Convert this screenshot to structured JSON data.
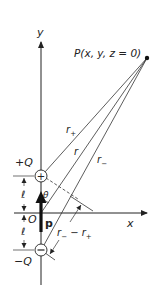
{
  "figure": {
    "type": "electric-dipole-geometry",
    "axes": {
      "x_label": "x",
      "y_label": "y",
      "origin_label": "O"
    },
    "point": {
      "label": "P(x, y, z = 0)"
    },
    "charges": {
      "positive": {
        "label": "+Q",
        "symbol": "+"
      },
      "negative": {
        "label": "−Q",
        "symbol": "−"
      }
    },
    "dipole_moment_label": "p",
    "distances": {
      "r_plus": "r",
      "r_plus_sub": "+",
      "r": "r",
      "r_minus": "r",
      "r_minus_sub": "−",
      "difference_a": "r",
      "difference_a_sub": "−",
      "difference_minus": " − r",
      "difference_b_sub": "+"
    },
    "half_separation_label": "ℓ",
    "angle_label": "θ",
    "colors": {
      "ink": "#222222",
      "background": "#ffffff"
    }
  }
}
